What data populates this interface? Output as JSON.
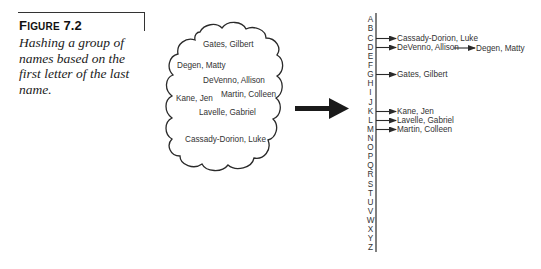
{
  "caption": {
    "figure_label_first": "F",
    "figure_label_rest": "IGURE",
    "figure_number": "7.2",
    "text": "Hashing a group of names based on the first letter of the last name."
  },
  "cloud": {
    "names": [
      {
        "label": "Gates, Gilbert",
        "x": 203,
        "y": 44
      },
      {
        "label": "Degen, Matty",
        "x": 177,
        "y": 65
      },
      {
        "label": "DeVenno, Allison",
        "x": 203,
        "y": 80
      },
      {
        "label": "Kane, Jen",
        "x": 175,
        "y": 98
      },
      {
        "label": "Martin, Colleen",
        "x": 221,
        "y": 94
      },
      {
        "label": "Lavelle, Gabriel",
        "x": 199,
        "y": 112
      },
      {
        "label": "Cassady-Dorion, Luke",
        "x": 185,
        "y": 139
      }
    ]
  },
  "hash_table": {
    "letters": [
      "A",
      "B",
      "C",
      "D",
      "E",
      "F",
      "G",
      "H",
      "I",
      "J",
      "K",
      "L",
      "M",
      "N",
      "O",
      "P",
      "Q",
      "R",
      "S",
      "T",
      "U",
      "V",
      "W",
      "X",
      "Y",
      "Z"
    ],
    "entries": [
      {
        "letter": "C",
        "index": 2,
        "names": [
          "Cassady-Dorion, Luke"
        ]
      },
      {
        "letter": "D",
        "index": 3,
        "names": [
          "DeVenno, Allison",
          "Degen, Matty"
        ]
      },
      {
        "letter": "G",
        "index": 6,
        "names": [
          "Gates, Gilbert"
        ]
      },
      {
        "letter": "K",
        "index": 10,
        "names": [
          "Kane, Jen"
        ]
      },
      {
        "letter": "L",
        "index": 11,
        "names": [
          "Lavelle, Gabriel"
        ]
      },
      {
        "letter": "M",
        "index": 12,
        "names": [
          "Martin, Colleen"
        ]
      }
    ]
  },
  "colors": {
    "line": "#2a2a2a",
    "text": "#333333",
    "background": "#ffffff"
  }
}
